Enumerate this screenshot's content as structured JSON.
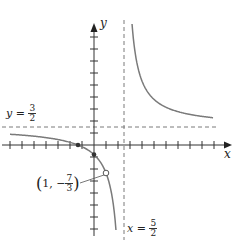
{
  "chart_data": {
    "type": "line",
    "title": "",
    "function": "f(x) = (3x + 4)/(2x - 5), with a hole at x = 1",
    "xlabel": "x",
    "ylabel": "y",
    "xlim": [
      -7.8,
      11.5
    ],
    "ylim": [
      -7.5,
      10.8
    ],
    "tick_spacing": 1,
    "grid": false,
    "asymptotes": {
      "horizontal": {
        "value": 1.5,
        "label": "y = 3/2"
      },
      "vertical": {
        "value": 2.5,
        "label": "x = 5/2"
      }
    },
    "hole": {
      "x": 1,
      "y": -2.3333,
      "label": "(1, −7/3)"
    },
    "intercepts": [
      {
        "x": -1.3333,
        "y": 0
      },
      {
        "x": 0,
        "y": -0.8
      }
    ],
    "series": [
      {
        "name": "left branch",
        "x": [
          -7,
          -6,
          -5,
          -4,
          -3,
          -2,
          -1,
          0,
          1,
          1.5,
          1.83
        ],
        "y": [
          0.895,
          0.824,
          0.733,
          0.615,
          0.455,
          0.222,
          -0.143,
          -0.8,
          -2.333,
          -4.25,
          -7.1
        ]
      },
      {
        "name": "right branch",
        "x": [
          3.17,
          3.5,
          4,
          5,
          6,
          7,
          8,
          9,
          9.92
        ],
        "y": [
          10.1,
          7.25,
          5.33,
          3.8,
          3.14,
          2.78,
          2.55,
          2.38,
          2.28
        ]
      }
    ],
    "colors": {
      "curve": "#7a7a7a",
      "axes": "#333333",
      "asymptote": "#7a7a7a"
    }
  },
  "labels": {
    "x_axis": "x",
    "y_axis": "y",
    "h_asymptote_lhs": "y =",
    "h_asymptote_num": "3",
    "h_asymptote_den": "2",
    "v_asymptote_lhs": "x =",
    "v_asymptote_num": "5",
    "v_asymptote_den": "2",
    "hole_x": "1,",
    "hole_sign": "−",
    "hole_num": "7",
    "hole_den": "3",
    "paren_open": "(",
    "paren_close": ")"
  }
}
